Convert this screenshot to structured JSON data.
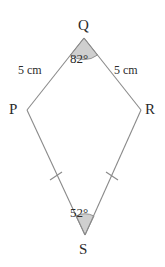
{
  "figure": {
    "shape_name": "kite",
    "stroke_color": "#8a8a8a",
    "wedge_fill": "#cfcfcf",
    "wedge_stroke": "#8a8a8a",
    "text_color": "#2b2b2b",
    "background": "#ffffff"
  },
  "vertices": [
    {
      "id": "Q",
      "label": "Q",
      "x": 84,
      "y": 38
    },
    {
      "id": "P",
      "label": "P",
      "x": 27,
      "y": 110
    },
    {
      "id": "R",
      "label": "R",
      "x": 141,
      "y": 110
    },
    {
      "id": "S",
      "label": "S",
      "x": 85,
      "y": 235
    }
  ],
  "sides": [
    {
      "id": "PQ",
      "from": "P",
      "to": "Q",
      "label": "5 cm",
      "ticks": 0
    },
    {
      "id": "QR",
      "from": "Q",
      "to": "R",
      "label": "5 cm",
      "ticks": 0
    },
    {
      "id": "PS",
      "from": "P",
      "to": "S",
      "label": "",
      "ticks": 1
    },
    {
      "id": "RS",
      "from": "R",
      "to": "S",
      "label": "",
      "ticks": 1
    }
  ],
  "angles": [
    {
      "id": "Q",
      "vertex": "Q",
      "label": "82°",
      "value": 82,
      "shaded": true
    },
    {
      "id": "S",
      "vertex": "S",
      "label": "52°",
      "value": 52,
      "shaded": true
    }
  ]
}
